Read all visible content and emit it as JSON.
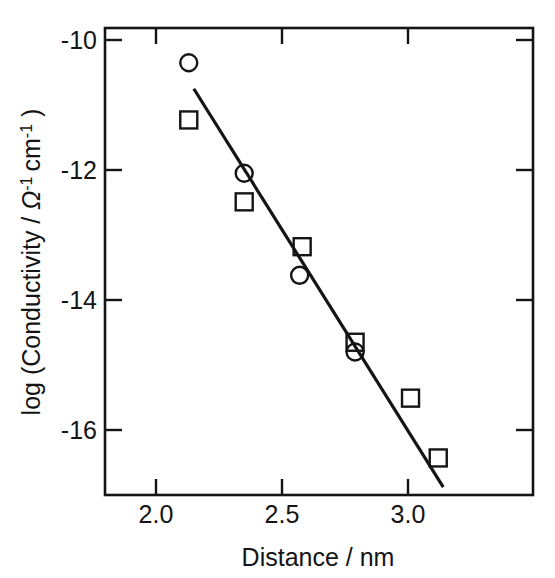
{
  "chart_data": {
    "type": "scatter",
    "title": "",
    "xlabel": "Distance / nm",
    "ylabel": "log (Conductivity / Ω⁻¹ cm⁻¹ )",
    "ylabel_parts": {
      "prefix": "log (Conductivity / ",
      "omega": "Ω",
      "omega_exp": "-1",
      "cm": "cm",
      "cm_exp": "-1",
      "suffix": " )"
    },
    "xlim": [
      1.8,
      3.5
    ],
    "ylim": [
      -17.3,
      -9.67
    ],
    "xticks": [
      2.0,
      2.5,
      3.0
    ],
    "xticklabels": [
      "2.0",
      "2.5",
      "3.0"
    ],
    "yticks": [
      -10,
      -12,
      -14,
      -16
    ],
    "yticklabels": [
      "-10",
      "-12",
      "-14",
      "-16"
    ],
    "grid": false,
    "legend": "none",
    "frame": "box",
    "tick_direction": "in",
    "series": [
      {
        "name": "circles",
        "marker": "open-circle",
        "color": "#141414",
        "points": [
          {
            "x": 2.13,
            "y": -10.35
          },
          {
            "x": 2.35,
            "y": -12.05
          },
          {
            "x": 2.57,
            "y": -13.62
          },
          {
            "x": 2.79,
            "y": -14.8
          }
        ]
      },
      {
        "name": "squares",
        "marker": "open-square",
        "color": "#141414",
        "points": [
          {
            "x": 2.13,
            "y": -11.23
          },
          {
            "x": 2.35,
            "y": -12.49
          },
          {
            "x": 2.58,
            "y": -13.18
          },
          {
            "x": 2.79,
            "y": -14.65
          },
          {
            "x": 3.01,
            "y": -15.51
          },
          {
            "x": 3.12,
            "y": -16.43
          }
        ]
      }
    ],
    "fit_line": {
      "name": "linear-fit",
      "color": "#141414",
      "x_start": 2.15,
      "y_start": -10.75,
      "x_end": 3.14,
      "y_end": -16.88,
      "slope": -6.19
    }
  }
}
